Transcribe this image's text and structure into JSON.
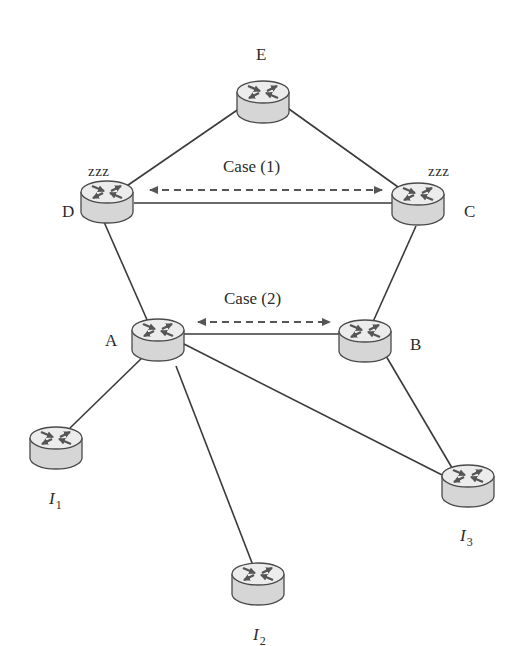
{
  "diagram": {
    "type": "network-topology",
    "colors": {
      "link": "#3a3a3a",
      "router_side": "#d6d6d6",
      "router_top": "#ececec",
      "router_outline": "#4a4a4a",
      "router_arrows": "#555555",
      "dashed_arrow": "#555555",
      "text": "#2b2b2b"
    },
    "nodes": [
      {
        "id": "E",
        "label": "E",
        "sleeping": false
      },
      {
        "id": "D",
        "label": "D",
        "sleeping": true,
        "sleep_label": "zzz"
      },
      {
        "id": "C",
        "label": "C",
        "sleeping": true,
        "sleep_label": "zzz"
      },
      {
        "id": "A",
        "label": "A",
        "sleeping": false
      },
      {
        "id": "B",
        "label": "B",
        "sleeping": false
      },
      {
        "id": "I1",
        "label": "I",
        "subscript": "1",
        "sleeping": false
      },
      {
        "id": "I2",
        "label": "I",
        "subscript": "2",
        "sleeping": false
      },
      {
        "id": "I3",
        "label": "I",
        "subscript": "3",
        "sleeping": false
      }
    ],
    "links": [
      [
        "E",
        "D"
      ],
      [
        "E",
        "C"
      ],
      [
        "D",
        "C"
      ],
      [
        "D",
        "A"
      ],
      [
        "C",
        "B"
      ],
      [
        "A",
        "B"
      ],
      [
        "A",
        "I1"
      ],
      [
        "A",
        "I2"
      ],
      [
        "A",
        "I3"
      ],
      [
        "B",
        "I3"
      ]
    ],
    "annotations": [
      {
        "label": "Case (1)",
        "between": [
          "D",
          "C"
        ],
        "style": "dashed-double-arrow"
      },
      {
        "label": "Case (2)",
        "between": [
          "A",
          "B"
        ],
        "style": "dashed-double-arrow"
      }
    ]
  }
}
